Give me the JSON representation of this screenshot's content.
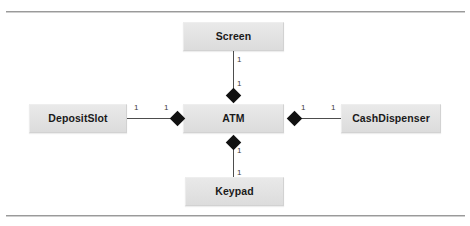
{
  "diagram": {
    "type": "uml-composition-class-diagram",
    "colors": {
      "box_fill": "#e2e2e2",
      "box_border": "#d2d2d2",
      "line": "#4d4d4d",
      "diamond": "#111111",
      "text": "#1a1a1a",
      "frame_rule": "#9a9a9a",
      "background": "#ffffff"
    },
    "classes": [
      {
        "id": "screen",
        "label": "Screen"
      },
      {
        "id": "atm",
        "label": "ATM"
      },
      {
        "id": "keypad",
        "label": "Keypad"
      },
      {
        "id": "depositslot",
        "label": "DepositSlot"
      },
      {
        "id": "cashdispenser",
        "label": "CashDispenser"
      }
    ],
    "relationships": [
      {
        "id": "atm-screen",
        "kind": "composition",
        "whole": "ATM",
        "part": "Screen",
        "whole_multiplicity": "1",
        "part_multiplicity": "1"
      },
      {
        "id": "atm-keypad",
        "kind": "composition",
        "whole": "ATM",
        "part": "Keypad",
        "whole_multiplicity": "1",
        "part_multiplicity": "1"
      },
      {
        "id": "atm-depositslot",
        "kind": "composition",
        "whole": "ATM",
        "part": "DepositSlot",
        "whole_multiplicity": "1",
        "part_multiplicity": "1"
      },
      {
        "id": "atm-cashdispenser",
        "kind": "composition",
        "whole": "ATM",
        "part": "CashDispenser",
        "whole_multiplicity": "1",
        "part_multiplicity": "1"
      }
    ],
    "multiplicities": {
      "screen_near_atm": "1",
      "screen_far": "1",
      "keypad_near_atm": "1",
      "keypad_far": "1",
      "depositslot_far": "1",
      "depositslot_near_atm": "1",
      "cashdispenser_near_atm": "1",
      "cashdispenser_far": "1"
    }
  }
}
